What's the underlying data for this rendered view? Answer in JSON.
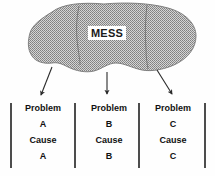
{
  "diagram": {
    "title_label": "MESS",
    "blob": {
      "name": "mess-blob",
      "fill_color": "#a8a8a8",
      "stroke_color": "#6e6e6e",
      "texture": "stipple-halftone"
    },
    "arrows": [
      {
        "name": "arrow-to-problem-a",
        "direction": "down-right"
      },
      {
        "name": "arrow-to-problem-b",
        "direction": "down"
      },
      {
        "name": "arrow-to-problem-c",
        "direction": "down-right"
      }
    ],
    "dividers": [
      {
        "name": "blob-divider-left"
      },
      {
        "name": "blob-divider-right"
      }
    ],
    "column_separators": [
      {
        "name": "column-separator-1"
      },
      {
        "name": "column-separator-2"
      },
      {
        "name": "column-separator-3"
      },
      {
        "name": "column-separator-4"
      }
    ],
    "columns": [
      {
        "problem_label": "Problem",
        "problem_id": "A",
        "cause_label": "Cause",
        "cause_id": "A"
      },
      {
        "problem_label": "Problem",
        "problem_id": "B",
        "cause_label": "Cause",
        "cause_id": "B"
      },
      {
        "problem_label": "Problem",
        "problem_id": "C",
        "cause_label": "Cause",
        "cause_id": "C"
      }
    ]
  }
}
